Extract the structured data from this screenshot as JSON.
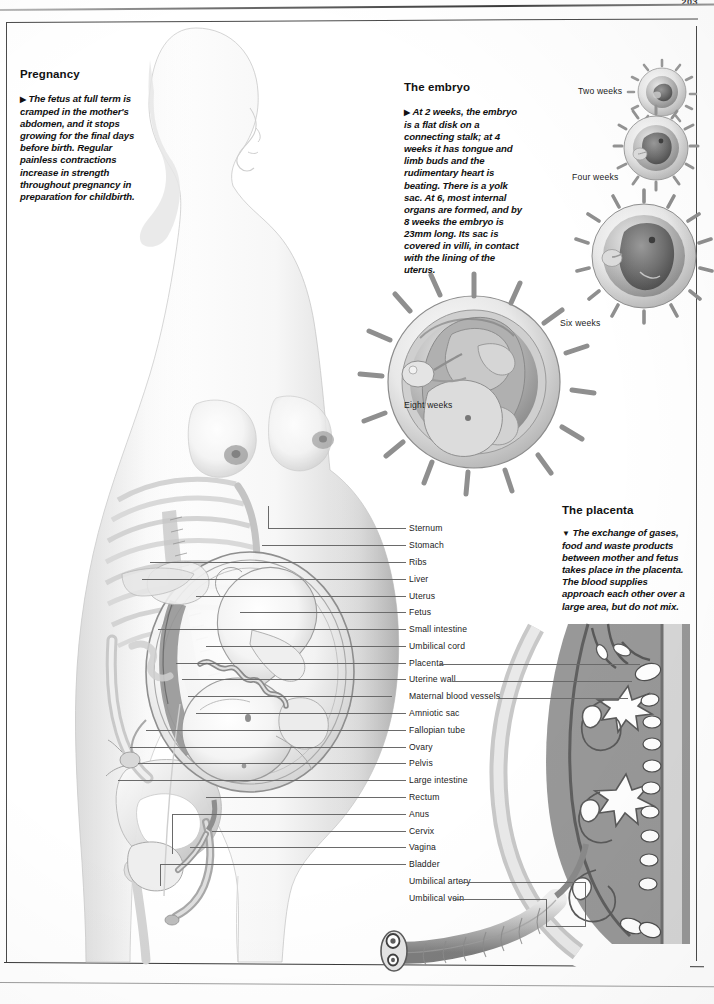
{
  "page": {
    "number": "203",
    "width": 714,
    "height": 1004,
    "ink_color": "#1b1b1b",
    "leader_color": "#6a6a6a",
    "paper_color": "#ffffff"
  },
  "sections": [
    {
      "id": "pregnancy",
      "heading": "Pregnancy",
      "marker": "▶",
      "body": "The fetus at full term is cramped in the mother's abdomen, and it stops growing for the final days before birth. Regular painless contractions increase in strength throughout pregnancy in preparation for childbirth."
    },
    {
      "id": "embryo",
      "heading": "The embryo",
      "marker": "▶",
      "body": "At 2 weeks, the embryo is a flat disk on a connecting stalk; at 4 weeks it has tongue and limb buds and the rudimentary heart is beating. There is a yolk sac. At 6, most internal organs are formed, and by 8 weeks the embryo is 23mm long. Its sac is covered in villi, in contact with the lining of the uterus."
    },
    {
      "id": "placenta",
      "heading": "The placenta",
      "marker": "▼",
      "body": "The exchange of gases, food and waste products between mother and fetus takes place in the placenta. The blood supplies approach each other over a large area, but do not mix."
    }
  ],
  "embryo_stages": [
    {
      "caption": "Two weeks",
      "x": 578,
      "y": 86,
      "size": 44
    },
    {
      "caption": "Four weeks",
      "x": 572,
      "y": 150,
      "size": 60
    },
    {
      "caption": "Six weeks",
      "x": 560,
      "y": 320,
      "size": 92
    },
    {
      "caption": "Eight weeks",
      "x": 404,
      "y": 403,
      "size": 170
    }
  ],
  "labels": [
    {
      "text": "Sternum",
      "y": 528,
      "line": "short"
    },
    {
      "text": "Stomach",
      "y": 545,
      "line": "short"
    },
    {
      "text": "Ribs",
      "y": 562,
      "line": "short"
    },
    {
      "text": "Liver",
      "y": 579,
      "line": "short"
    },
    {
      "text": "Uterus",
      "y": 596,
      "line": "short"
    },
    {
      "text": "Fetus",
      "y": 612,
      "line": "short"
    },
    {
      "text": "Small intestine",
      "y": 629,
      "line": "short"
    },
    {
      "text": "Umbilical cord",
      "y": 646,
      "line": "short"
    },
    {
      "text": "Placenta",
      "y": 663,
      "line": "both"
    },
    {
      "text": "Uterine wall",
      "y": 679,
      "line": "both"
    },
    {
      "text": "Maternal blood vessels",
      "y": 696,
      "line": "right"
    },
    {
      "text": "Amniotic sac",
      "y": 713,
      "line": "short"
    },
    {
      "text": "Fallopian tube",
      "y": 730,
      "line": "short"
    },
    {
      "text": "Ovary",
      "y": 747,
      "line": "short"
    },
    {
      "text": "Pelvis",
      "y": 763,
      "line": "short"
    },
    {
      "text": "Large intestine",
      "y": 780,
      "line": "short"
    },
    {
      "text": "Rectum",
      "y": 797,
      "line": "short"
    },
    {
      "text": "Anus",
      "y": 814,
      "line": "short"
    },
    {
      "text": "Cervix",
      "y": 831,
      "line": "short"
    },
    {
      "text": "Vagina",
      "y": 847,
      "line": "short"
    },
    {
      "text": "Bladder",
      "y": 864,
      "line": "short"
    },
    {
      "text": "Umbilical artery",
      "y": 881,
      "line": "right"
    },
    {
      "text": "Umbilical vein",
      "y": 898,
      "line": "right"
    }
  ],
  "illustrations": [
    {
      "name": "pregnant-woman-sagittal-figure",
      "alt": "Full-body side view of a pregnant woman with skeleton, uterus and full-term fetus visible"
    },
    {
      "name": "embryo-eight-weeks-illustration",
      "alt": "Large cutaway of an eight week embryo inside a villi-covered sac"
    },
    {
      "name": "placenta-cross-section-illustration",
      "alt": "Cross-section through the placenta showing villi, maternal blood vessels and the umbilical cord"
    }
  ]
}
